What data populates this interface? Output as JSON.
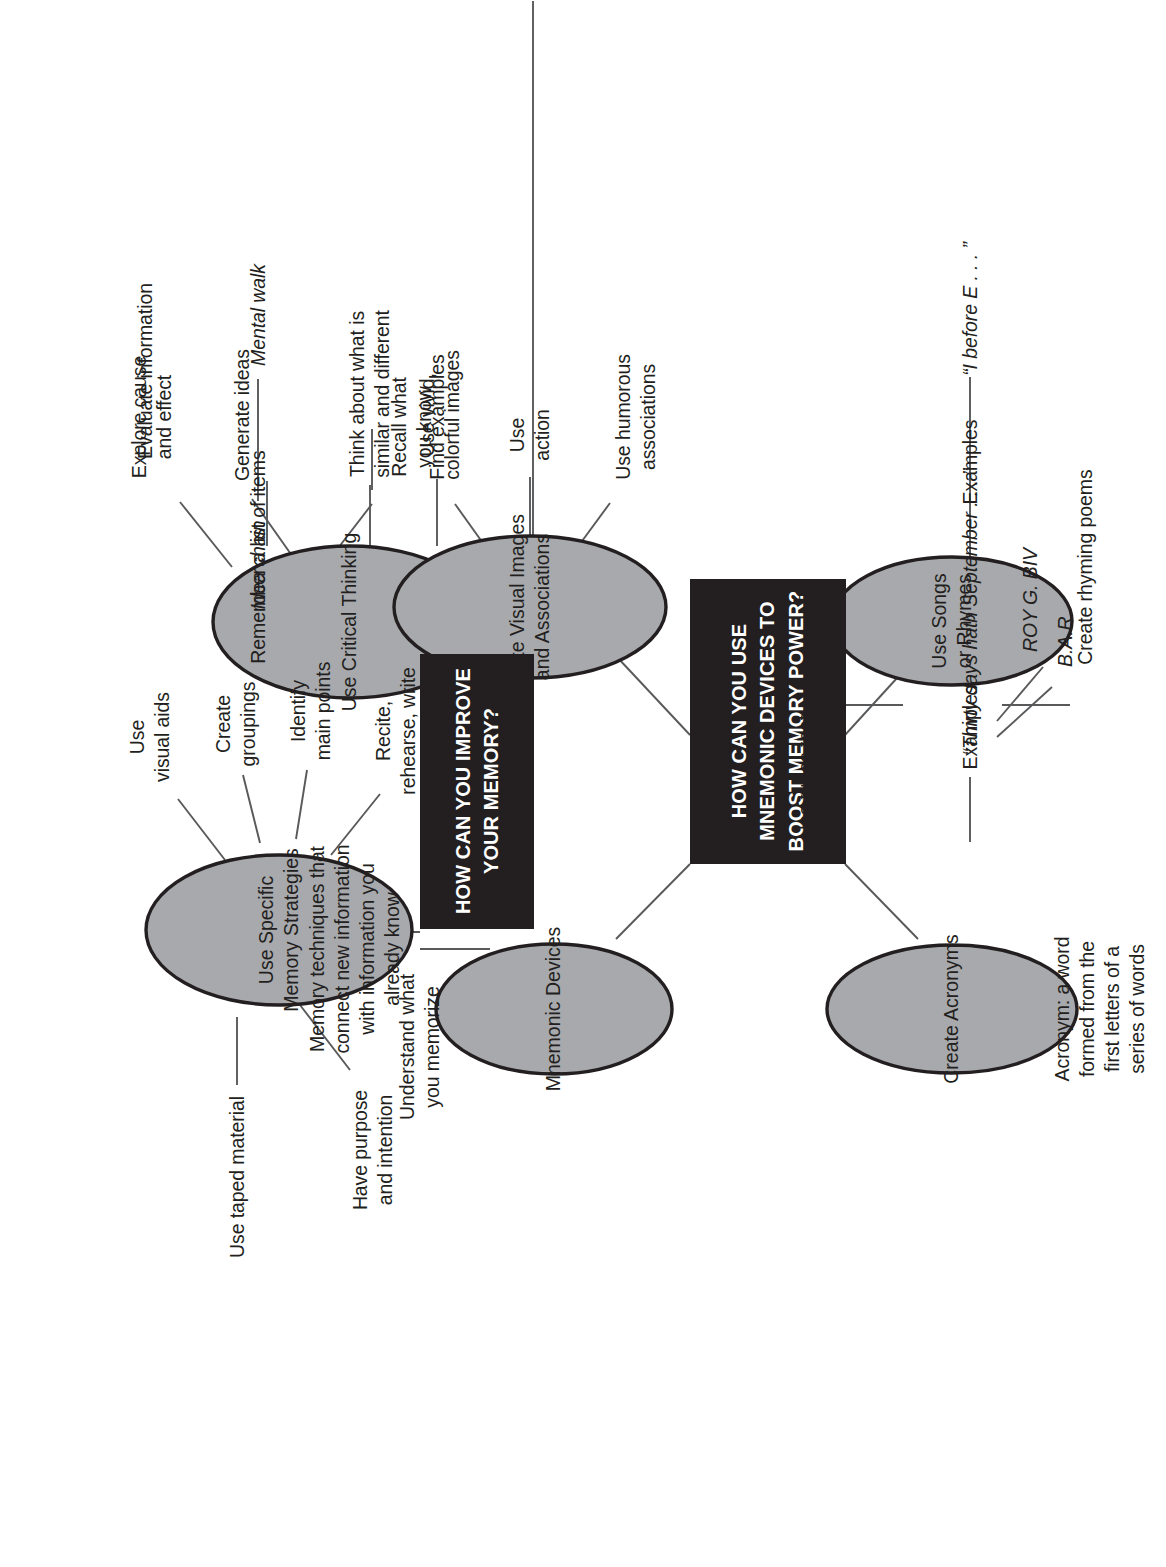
{
  "diagram": {
    "type": "concept-map",
    "orientation": "rotated-90-counterclockwise",
    "colors": {
      "box_fill": "#231f20",
      "box_text": "#ffffff",
      "ellipse_fill": "#a7a9ac",
      "ellipse_stroke": "#231f20",
      "line": "#58595b",
      "text": "#231f20",
      "background": "#ffffff"
    }
  },
  "boxes": [
    {
      "id": "box-improve-memory",
      "label": "HOW CAN YOU IMPROVE\nYOUR MEMORY?"
    },
    {
      "id": "box-mnemonic-devices",
      "label": "HOW CAN YOU USE\nMNEMONIC DEVICES TO\nBOOST MEMORY POWER?"
    }
  ],
  "ellipses": [
    {
      "id": "ellipse-critical-thinking",
      "label": "Use Critical Thinking"
    },
    {
      "id": "ellipse-memory-strategies",
      "label": "Use Specific\nMemory Strategies"
    },
    {
      "id": "ellipse-mnemonic-devices",
      "label": "Mnemonic Devices"
    },
    {
      "id": "ellipse-visual-images",
      "label": "Create Visual Images\nand Associations"
    },
    {
      "id": "ellipse-create-acronyms",
      "label": "Create Acronyms"
    },
    {
      "id": "ellipse-songs-rhymes",
      "label": "Use Songs\nor Rhymes"
    }
  ],
  "branches": {
    "critical_thinking": [
      {
        "id": "leaf-generate-ideas",
        "label": "Generate ideas"
      },
      {
        "id": "leaf-evaluate-information",
        "label": "Evaluate information"
      },
      {
        "id": "leaf-explore-cause-effect",
        "label": "Explore cause\nand effect"
      },
      {
        "id": "leaf-find-examples",
        "label": "Find examples"
      },
      {
        "id": "leaf-similar-different",
        "label": "Think about what is\nsimilar and different"
      },
      {
        "id": "leaf-recall-what-you-know",
        "label": "Recall what\nyou know"
      }
    ],
    "memory_strategies": [
      {
        "id": "leaf-use-visual-aids",
        "label": "Use\nvisual aids"
      },
      {
        "id": "leaf-create-groupings",
        "label": "Create\ngroupings"
      },
      {
        "id": "leaf-identify-main-points",
        "label": "Identify\nmain points"
      },
      {
        "id": "leaf-recite-rehearse-write",
        "label": "Recite,\nrehearse, write"
      },
      {
        "id": "leaf-use-taped-material",
        "label": "Use taped material"
      },
      {
        "id": "leaf-have-purpose",
        "label": "Have purpose\nand intention"
      },
      {
        "id": "leaf-understand-memorize",
        "label": "Understand what\nyou memorize"
      }
    ],
    "mnemonic_definition": {
      "id": "leaf-mnemonic-definition",
      "label": "Memory techniques that\nconnect new information\nwith information you\nalready know"
    },
    "visual_images": [
      {
        "id": "leaf-remember-list",
        "label": "Remember a list of items"
      },
      {
        "id": "leaf-mental-walk",
        "label": "Mental walk",
        "italic": true
      },
      {
        "id": "leaf-idea-chain",
        "label": "Idea chain",
        "italic": true
      },
      {
        "id": "leaf-vivid-colorful",
        "label": "Use vivid,\ncolorful images"
      },
      {
        "id": "leaf-use-action",
        "label": "Use\naction"
      },
      {
        "id": "leaf-humorous-associations",
        "label": "Use humorous\nassociations"
      }
    ],
    "acronyms": [
      {
        "id": "leaf-acronym-definition",
        "label": "Acronym: a word\nformed from the\nfirst letters of a\nseries of words"
      },
      {
        "id": "leaf-acronym-examples",
        "label": "Examples"
      },
      {
        "id": "leaf-example-bar",
        "label": "B.A.R.",
        "italic": true
      },
      {
        "id": "leaf-example-roygbiv",
        "label": "ROY G. BIV",
        "italic": true
      }
    ],
    "songs_rhymes": [
      {
        "id": "leaf-use-tunes",
        "label": "Use tunes that\nare familiar"
      },
      {
        "id": "leaf-create-rhyming-poems",
        "label": "Create rhyming poems"
      },
      {
        "id": "leaf-rhyme-examples",
        "label": "Examples"
      },
      {
        "id": "leaf-example-thirty-days",
        "label": "“Thirty days hath September . . . ”",
        "italic": true
      },
      {
        "id": "leaf-example-i-before-e",
        "label": "“I before E . . . ”",
        "italic": true
      }
    ]
  }
}
